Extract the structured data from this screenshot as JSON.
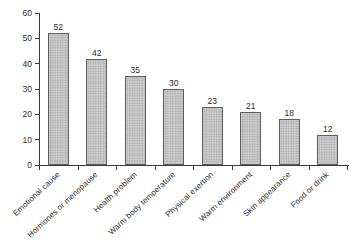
{
  "figure": {
    "background": "#ffffff",
    "width_px": 357,
    "height_px": 252
  },
  "chart_data": {
    "type": "bar",
    "title": "",
    "xlabel": "",
    "ylabel": "",
    "categories": [
      "Emotional cause",
      "Hormones or menopause",
      "Health problem",
      "Warm body temperature",
      "Physical exertion",
      "Warm environment",
      "Skin appearance",
      "Food or drink"
    ],
    "values": [
      52,
      42,
      35,
      30,
      23,
      21,
      18,
      12
    ],
    "value_labels_shown": true,
    "ylim": [
      0,
      60
    ],
    "yticks": [
      0,
      10,
      20,
      30,
      40,
      50,
      60
    ],
    "grid": false,
    "legend_position": "none",
    "x_tick_label_rotation_deg": -43,
    "styles": {
      "bar_fill": "#c9c9c9",
      "bar_stipple": "#9e9e9e",
      "bar_border": "#5f5f5f",
      "axis_color": "#3a3a3a",
      "text_color": "#2e2e2e"
    }
  }
}
